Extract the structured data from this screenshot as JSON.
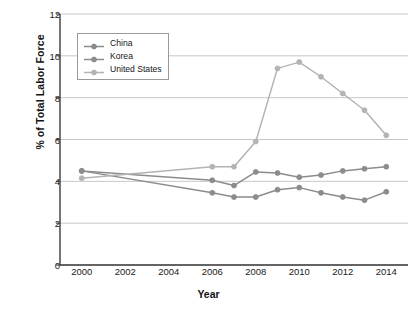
{
  "chart_data": {
    "type": "line",
    "title": "",
    "xlabel": "Year",
    "ylabel": "% of Total Labor Force",
    "xlim": [
      1999,
      2015
    ],
    "ylim": [
      0,
      12
    ],
    "yticks": [
      0,
      2,
      4,
      6,
      8,
      10,
      12
    ],
    "xticks": [
      2000,
      2002,
      2004,
      2006,
      2008,
      2010,
      2012,
      2014
    ],
    "grid": "horizontal",
    "legend_position": "upper-left",
    "x": [
      2000,
      2006,
      2007,
      2008,
      2009,
      2010,
      2011,
      2012,
      2013,
      2014
    ],
    "series": [
      {
        "name": "China",
        "color": "#8c8c8c",
        "x": [
          2000,
          2006,
          2007,
          2008,
          2009,
          2010,
          2011,
          2012,
          2013,
          2014
        ],
        "values": [
          4.5,
          4.05,
          3.8,
          4.45,
          4.4,
          4.2,
          4.3,
          4.5,
          4.6,
          4.7
        ]
      },
      {
        "name": "Korea",
        "color": "#8c8c8c",
        "x": [
          2000,
          2006,
          2007,
          2008,
          2009,
          2010,
          2011,
          2012,
          2013,
          2014
        ],
        "values": [
          4.5,
          3.45,
          3.25,
          3.25,
          3.6,
          3.7,
          3.45,
          3.25,
          3.1,
          3.5
        ]
      },
      {
        "name": "United States",
        "color": "#b3b3b3",
        "x": [
          2000,
          2006,
          2007,
          2008,
          2009,
          2010,
          2011,
          2012,
          2013,
          2014
        ],
        "values": [
          4.15,
          4.7,
          4.7,
          5.9,
          9.4,
          9.7,
          9.0,
          8.2,
          7.4,
          6.2
        ]
      }
    ]
  },
  "axes": {
    "ylabel": "% of Total Labor Force",
    "xlabel": "Year",
    "ytick_labels": [
      "0",
      "2",
      "4",
      "6",
      "8",
      "10",
      "12"
    ],
    "xtick_labels": [
      "2000",
      "2002",
      "2004",
      "2006",
      "2008",
      "2010",
      "2012",
      "2014"
    ]
  },
  "legend": {
    "entries": [
      {
        "label": "China"
      },
      {
        "label": "Korea"
      },
      {
        "label": "United States"
      }
    ]
  },
  "style": {
    "grid_color": "#b9b9b9",
    "axis_color": "#3a3a3a",
    "dark_series_color": "#8c8c8c",
    "light_series_color": "#b3b3b3",
    "background": "#ffffff"
  }
}
